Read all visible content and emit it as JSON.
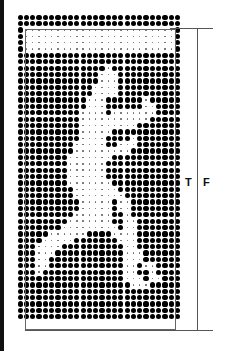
{
  "figure": {
    "labels": {
      "t": "T",
      "f": "F"
    },
    "legend": {
      "large_dot": "#",
      "small_dot": "."
    },
    "dot_map": [
      "##########################",
      "##########################",
      "#........................#",
      "#........................#",
      "#........................#",
      "#........................#",
      "##########################",
      "##########################",
      "##############.###########",
      "#############...##########",
      "#############...##########",
      "############....##########",
      "############....##########",
      "###########...######.#####",
      "###########...######..####",
      "##########....#.......####",
      "##########...........#####",
      "##########.........#######",
      "##########.....###########",
      "##########....####.#######",
      "#########.....##...#######",
      "#########.........########",
      "########.......###########",
      "########......############",
      "########......############",
      "########......############",
      "########.......###########",
      "#########.......##########",
      "#########........#########",
      "##########.....#..########",
      "##########.....#..########",
      "#########......##.########",
      "########.......##..#######",
      "#######.........#..#######",
      "#####......####....#######",
      "####.....#######...#######",
      "###....##########..#######",
      "###...###########...######",
      "###..############...######",
      "###..############..#..####",
      "###.#############..##.####",
      "#################...#..###",
      "##################...#####",
      "##########################",
      "##########################",
      "##########################",
      "##########################",
      "##########################"
    ]
  }
}
